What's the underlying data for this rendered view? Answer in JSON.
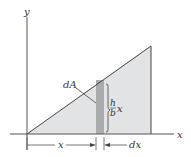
{
  "figure": {
    "type": "triangular-area-element-diagram",
    "labels": {
      "y_axis": "y",
      "x_axis": "x",
      "element": "dA",
      "height_num": "h",
      "height_den": "b",
      "height_var": "x",
      "dim_x": "x",
      "dim_dx": "dx"
    },
    "colors": {
      "triangle_fill": "#e2e3e5",
      "strip_fill": "#a9abad",
      "line": "#444444",
      "background": "#ffffff"
    }
  }
}
